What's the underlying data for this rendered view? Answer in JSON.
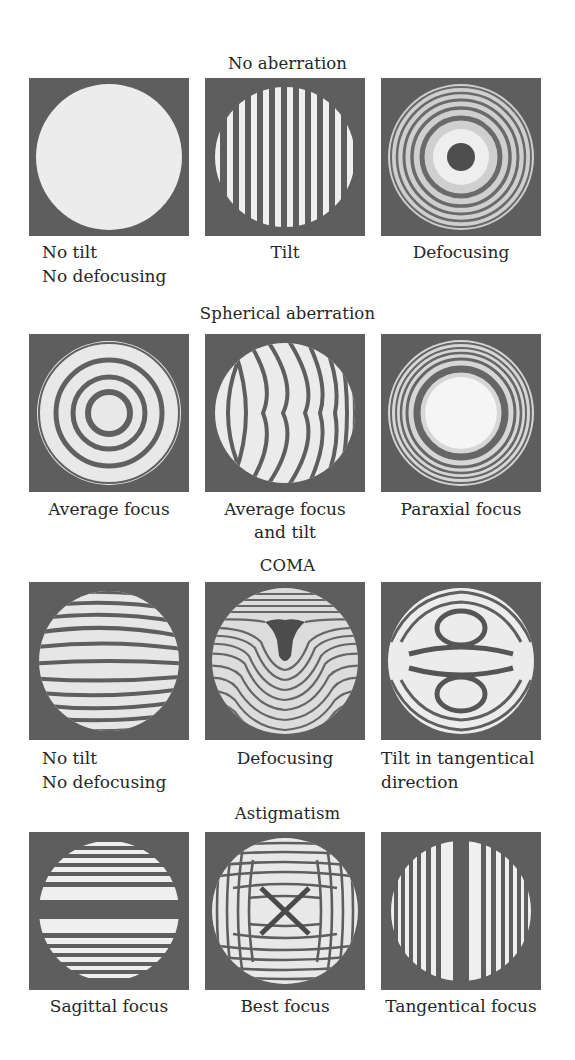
{
  "figure": {
    "sections": [
      {
        "title": "No aberration",
        "panels": [
          {
            "caption_line1": "No tilt",
            "caption_line2": "No defocusing",
            "pattern": "uniform-disk"
          },
          {
            "caption_line1": "Tilt",
            "caption_line2": "",
            "pattern": "vertical-straight-fringes"
          },
          {
            "caption_line1": "Defocusing",
            "caption_line2": "",
            "pattern": "concentric-rings-dark-center"
          }
        ]
      },
      {
        "title": "Spherical aberration",
        "panels": [
          {
            "caption_line1": "Average focus",
            "caption_line2": "",
            "pattern": "concentric-rings-bright-center"
          },
          {
            "caption_line1": "Average focus",
            "caption_line2": "and tilt",
            "pattern": "curved-vertical-fringes"
          },
          {
            "caption_line1": "Paraxial focus",
            "caption_line2": "",
            "pattern": "large-bright-center-rings"
          }
        ]
      },
      {
        "title": "COMA",
        "panels": [
          {
            "caption_line1": "No tilt",
            "caption_line2": "No defocusing",
            "pattern": "bowed-horizontal-fringes"
          },
          {
            "caption_line1": "Defocusing",
            "caption_line2": "",
            "pattern": "u-shaped-fringes"
          },
          {
            "caption_line1": "Tilt in tangentical",
            "caption_line2": "direction",
            "pattern": "double-lobe-fringes"
          }
        ]
      },
      {
        "title": "Astigmatism",
        "panels": [
          {
            "caption_line1": "Sagittal focus",
            "caption_line2": "",
            "pattern": "horizontal-fringes"
          },
          {
            "caption_line1": "Best focus",
            "caption_line2": "",
            "pattern": "saddle-hyperbolic-fringes"
          },
          {
            "caption_line1": "Tangentical focus",
            "caption_line2": "",
            "pattern": "vertical-fringes-dark-center"
          }
        ]
      }
    ],
    "colors": {
      "frame_background": "#5e5e5e",
      "fringe_bright": "#f0f0f0",
      "fringe_dark": "#5a5a5a",
      "text": "#262626"
    }
  }
}
